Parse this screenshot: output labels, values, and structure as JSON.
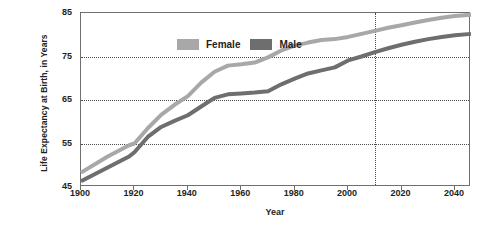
{
  "chart_data": {
    "type": "line",
    "title": "",
    "xlabel": "Year",
    "ylabel": "Life Expectancy at Birth, in Years",
    "xlim": [
      1900,
      2046
    ],
    "ylim": [
      45,
      85
    ],
    "xticks": [
      1900,
      1920,
      1940,
      1960,
      1980,
      2000,
      2020,
      2040
    ],
    "yticks": [
      45,
      55,
      65,
      75,
      85
    ],
    "grid": "horizontal-dotted-at-55-65-75, vertical-dotted-at-2010",
    "legend_position": "top-left-inside",
    "annotations": [
      {
        "type": "vertical-line",
        "x": 2010,
        "style": "dotted",
        "label": ""
      }
    ],
    "series": [
      {
        "name": "Female",
        "color": "#a8a8a8",
        "x": [
          1900,
          1910,
          1918,
          1920,
          1925,
          1930,
          1935,
          1940,
          1945,
          1950,
          1955,
          1960,
          1965,
          1970,
          1975,
          1980,
          1985,
          1990,
          1995,
          2000,
          2005,
          2010,
          2015,
          2020,
          2025,
          2030,
          2035,
          2040,
          2046
        ],
        "values": [
          48.3,
          52.0,
          54.6,
          55.0,
          58.5,
          61.6,
          63.9,
          65.9,
          69.0,
          71.5,
          72.9,
          73.2,
          73.6,
          74.8,
          76.4,
          77.5,
          78.2,
          78.8,
          79.0,
          79.5,
          80.2,
          80.9,
          81.6,
          82.2,
          82.8,
          83.4,
          83.9,
          84.3,
          84.6
        ]
      },
      {
        "name": "Male",
        "color": "#6e6e6e",
        "x": [
          1900,
          1910,
          1918,
          1920,
          1925,
          1930,
          1935,
          1940,
          1945,
          1950,
          1955,
          1960,
          1965,
          1970,
          1975,
          1980,
          1985,
          1990,
          1995,
          2000,
          2005,
          2010,
          2015,
          2020,
          2025,
          2030,
          2035,
          2040,
          2046
        ],
        "values": [
          46.3,
          49.5,
          52.0,
          53.0,
          56.5,
          58.8,
          60.2,
          61.5,
          63.5,
          65.5,
          66.3,
          66.5,
          66.7,
          67.0,
          68.6,
          69.9,
          71.1,
          71.8,
          72.5,
          74.1,
          75.0,
          76.0,
          76.9,
          77.7,
          78.4,
          79.0,
          79.5,
          79.9,
          80.2
        ]
      }
    ]
  },
  "legend": {
    "items": [
      {
        "label": "Female",
        "color": "#a8a8a8"
      },
      {
        "label": "Male",
        "color": "#6e6e6e"
      }
    ]
  },
  "axes": {
    "y_title": "Life Expectancy at Birth, in Years",
    "x_title": "Year",
    "y_ticks": [
      "85",
      "75",
      "65",
      "55",
      "45"
    ],
    "x_ticks": [
      "1900",
      "1920",
      "1940",
      "1960",
      "1980",
      "2000",
      "2020",
      "2040"
    ]
  },
  "colors": {
    "female": "#a8a8a8",
    "male": "#6e6e6e",
    "frame": "#6f6f6f",
    "grid": "#4a4a4a",
    "text": "#231f20",
    "background": "#ffffff"
  }
}
